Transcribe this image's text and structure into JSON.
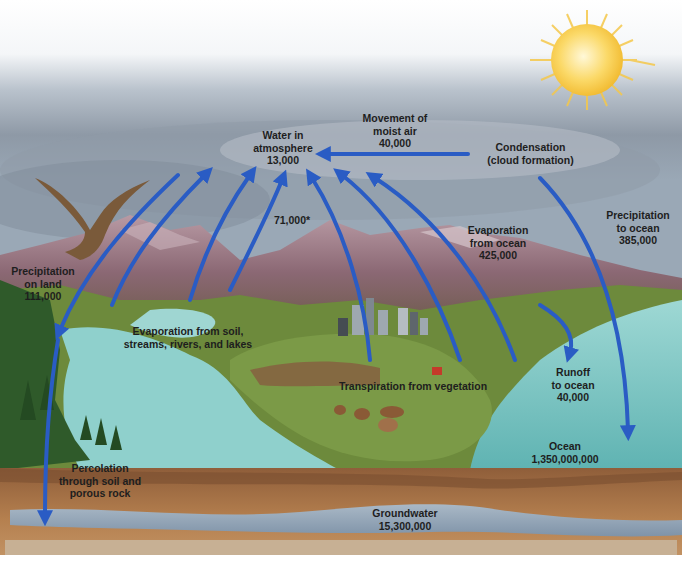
{
  "diagram": {
    "colors": {
      "arrow": "#2a5cc4",
      "sky_top": "#ffffff",
      "cloud": "#8c98a6",
      "mountain": "#8a6a78",
      "grass": "#6a8a3a",
      "ocean": "#7cc6c4",
      "soil": "#a8734a",
      "groundwater": "#8fa2b6",
      "sun": "#f7c531"
    },
    "labels": {
      "atmosphere": {
        "line1": "Water in",
        "line2": "atmosphere",
        "value": "13,000"
      },
      "moist_air": {
        "line1": "Movement of",
        "line2": "moist air",
        "value": "40,000"
      },
      "condensation": {
        "line1": "Condensation",
        "line2": "(cloud formation)"
      },
      "precip_ocean": {
        "line1": "Precipitation",
        "line2": "to ocean",
        "value": "385,000"
      },
      "evap_ocean": {
        "line1": "Evaporation",
        "line2": "from ocean",
        "value": "425,000"
      },
      "total_evap": {
        "value": "71,000*"
      },
      "precip_land": {
        "line1": "Precipitation",
        "line2": "on land",
        "value": "111,000"
      },
      "evap_soil": {
        "line1": "Evaporation from soil,",
        "line2": "streams, rivers, and lakes"
      },
      "transpiration": {
        "line1": "Transpiration from vegetation"
      },
      "runoff": {
        "line1": "Runoff",
        "line2": "to ocean",
        "value": "40,000"
      },
      "ocean": {
        "line1": "Ocean",
        "value": "1,350,000,000"
      },
      "percolation": {
        "line1": "Percolation",
        "line2": "through soil and",
        "line3": "porous rock"
      },
      "groundwater": {
        "line1": "Groundwater",
        "value": "15,300,000"
      }
    }
  }
}
